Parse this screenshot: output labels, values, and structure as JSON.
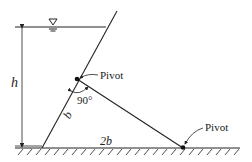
{
  "diagram": {
    "labels": {
      "height": "h",
      "gate_length": "b",
      "base_length": "2b",
      "angle": "90°",
      "pivot_top": "Pivot",
      "pivot_bottom": "Pivot"
    },
    "symbols": {
      "water_surface": "free-surface-triangle-icon"
    },
    "colors": {
      "line": "#222222",
      "background": "#ffffff"
    }
  }
}
